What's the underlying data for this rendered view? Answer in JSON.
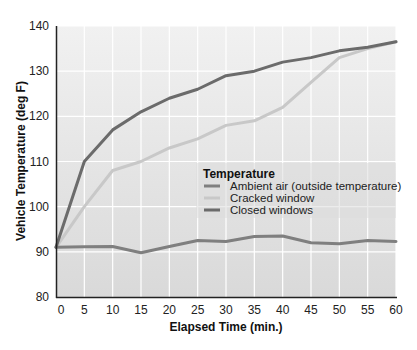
{
  "chart_data": {
    "type": "line",
    "title": "",
    "xlabel": "Elapsed Time (min.)",
    "ylabel": "Vehicle Temperature (deg F)",
    "x": [
      0,
      5,
      10,
      15,
      20,
      25,
      30,
      35,
      40,
      45,
      50,
      55,
      60
    ],
    "xlim": [
      0,
      60
    ],
    "ylim": [
      80,
      140
    ],
    "x_ticks": [
      0,
      5,
      10,
      15,
      20,
      25,
      30,
      35,
      40,
      45,
      50,
      55,
      60
    ],
    "y_ticks": [
      80,
      90,
      100,
      110,
      120,
      130,
      140
    ],
    "grid": true,
    "legend": {
      "title": "Temperature",
      "position": "center-right inside plot"
    },
    "series": [
      {
        "name": "Ambient air (outside temperature)",
        "color": "#7f7f7f",
        "values": [
          91,
          91.1,
          91.2,
          89.8,
          91.2,
          92.5,
          92.3,
          93.4,
          93.5,
          92,
          91.8,
          92.5,
          92.3
        ]
      },
      {
        "name": "Cracked window",
        "color": "#c8c8c8",
        "values": [
          91,
          100,
          108,
          110,
          113,
          115,
          118,
          119,
          122,
          127.5,
          133,
          135,
          136.5
        ]
      },
      {
        "name": "Closed windows",
        "color": "#6b6b6b",
        "values": [
          91,
          110,
          117,
          121,
          124,
          126,
          129,
          130,
          132,
          133,
          134.5,
          135.3,
          136.5
        ]
      }
    ]
  }
}
